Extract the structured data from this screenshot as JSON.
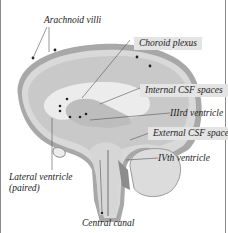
{
  "diagram": {
    "labels": {
      "arachnoid_villi": "Arachnoid villi",
      "choroid_plexus": "Choroid plexus",
      "internal_csf": "Internal CSF spaces",
      "third_ventricle": "IIIrd ventricle",
      "external_csf": "External CSF spaces",
      "fourth_ventricle": "IVth ventricle",
      "lateral_ventricle": "Lateral ventricle",
      "lateral_ventricle_note": "(paired)",
      "central_canal": "Central canal"
    },
    "colors": {
      "outer_membrane": "#a8a8a8",
      "csf_space": "#d9d9d9",
      "brain_tissue": "#c9c9c9",
      "ventricle": "#ececec",
      "dark_space": "#8c8c8c",
      "label_box": "#e4e4e4"
    }
  }
}
